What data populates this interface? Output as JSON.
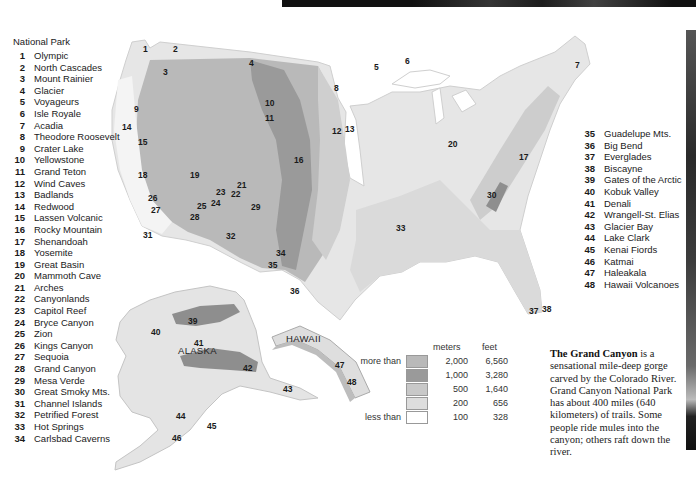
{
  "legend": {
    "title": "National Park",
    "parks_left": [
      {
        "num": "1",
        "name": "Olympic"
      },
      {
        "num": "2",
        "name": "North Cascades"
      },
      {
        "num": "3",
        "name": "Mount Rainier"
      },
      {
        "num": "4",
        "name": "Glacier"
      },
      {
        "num": "5",
        "name": "Voyageurs"
      },
      {
        "num": "6",
        "name": "Isle Royale"
      },
      {
        "num": "7",
        "name": "Acadia"
      },
      {
        "num": "8",
        "name": "Theodore Roosevelt"
      },
      {
        "num": "9",
        "name": "Crater Lake"
      },
      {
        "num": "10",
        "name": "Yellowstone"
      },
      {
        "num": "11",
        "name": "Grand Teton"
      },
      {
        "num": "12",
        "name": "Wind Caves"
      },
      {
        "num": "13",
        "name": "Badlands"
      },
      {
        "num": "14",
        "name": "Redwood"
      },
      {
        "num": "15",
        "name": "Lassen Volcanic"
      },
      {
        "num": "16",
        "name": "Rocky Mountain"
      },
      {
        "num": "17",
        "name": "Shenandoah"
      },
      {
        "num": "18",
        "name": "Yosemite"
      },
      {
        "num": "19",
        "name": "Great Basin"
      },
      {
        "num": "20",
        "name": "Mammoth Cave"
      },
      {
        "num": "21",
        "name": "Arches"
      },
      {
        "num": "22",
        "name": "Canyonlands"
      },
      {
        "num": "23",
        "name": "Capitol Reef"
      },
      {
        "num": "24",
        "name": "Bryce Canyon"
      },
      {
        "num": "25",
        "name": "Zion"
      },
      {
        "num": "26",
        "name": "Kings Canyon"
      },
      {
        "num": "27",
        "name": "Sequoia"
      },
      {
        "num": "28",
        "name": "Grand Canyon"
      },
      {
        "num": "29",
        "name": "Mesa Verde"
      },
      {
        "num": "30",
        "name": "Great Smoky Mts."
      },
      {
        "num": "31",
        "name": "Channel Islands"
      },
      {
        "num": "32",
        "name": "Petrified Forest"
      },
      {
        "num": "33",
        "name": "Hot Springs"
      },
      {
        "num": "34",
        "name": "Carlsbad Caverns"
      }
    ],
    "parks_right": [
      {
        "num": "35",
        "name": "Guadelupe Mts."
      },
      {
        "num": "36",
        "name": "Big Bend"
      },
      {
        "num": "37",
        "name": "Everglades"
      },
      {
        "num": "38",
        "name": "Biscayne"
      },
      {
        "num": "39",
        "name": "Gates of the Arctic"
      },
      {
        "num": "40",
        "name": "Kobuk Valley"
      },
      {
        "num": "41",
        "name": "Denali"
      },
      {
        "num": "42",
        "name": "Wrangell-St. Elias"
      },
      {
        "num": "43",
        "name": "Glacier Bay"
      },
      {
        "num": "44",
        "name": "Lake Clark"
      },
      {
        "num": "45",
        "name": "Kenai Fiords"
      },
      {
        "num": "46",
        "name": "Katmai"
      },
      {
        "num": "47",
        "name": "Haleakala"
      },
      {
        "num": "48",
        "name": "Hawaii Volcanoes"
      }
    ]
  },
  "map": {
    "region_labels": {
      "alaska": "ALASKA",
      "hawaii": "HAWAII"
    },
    "markers": [
      {
        "num": "1",
        "x": 143,
        "y": 44
      },
      {
        "num": "2",
        "x": 173,
        "y": 44
      },
      {
        "num": "3",
        "x": 163,
        "y": 67
      },
      {
        "num": "4",
        "x": 249,
        "y": 58
      },
      {
        "num": "5",
        "x": 374,
        "y": 62
      },
      {
        "num": "6",
        "x": 405,
        "y": 56
      },
      {
        "num": "7",
        "x": 575,
        "y": 60
      },
      {
        "num": "8",
        "x": 334,
        "y": 83
      },
      {
        "num": "9",
        "x": 134,
        "y": 104
      },
      {
        "num": "10",
        "x": 265,
        "y": 98
      },
      {
        "num": "11",
        "x": 265,
        "y": 113
      },
      {
        "num": "12",
        "x": 332,
        "y": 126
      },
      {
        "num": "13",
        "x": 345,
        "y": 124
      },
      {
        "num": "14",
        "x": 122,
        "y": 122
      },
      {
        "num": "15",
        "x": 138,
        "y": 137
      },
      {
        "num": "16",
        "x": 294,
        "y": 155
      },
      {
        "num": "17",
        "x": 519,
        "y": 152
      },
      {
        "num": "18",
        "x": 138,
        "y": 170
      },
      {
        "num": "19",
        "x": 190,
        "y": 170
      },
      {
        "num": "20",
        "x": 448,
        "y": 139
      },
      {
        "num": "21",
        "x": 237,
        "y": 180
      },
      {
        "num": "22",
        "x": 231,
        "y": 189
      },
      {
        "num": "23",
        "x": 216,
        "y": 187
      },
      {
        "num": "24",
        "x": 211,
        "y": 198
      },
      {
        "num": "25",
        "x": 197,
        "y": 201
      },
      {
        "num": "26",
        "x": 148,
        "y": 193
      },
      {
        "num": "27",
        "x": 151,
        "y": 205
      },
      {
        "num": "28",
        "x": 190,
        "y": 212
      },
      {
        "num": "29",
        "x": 251,
        "y": 202
      },
      {
        "num": "30",
        "x": 487,
        "y": 190
      },
      {
        "num": "31",
        "x": 143,
        "y": 230
      },
      {
        "num": "32",
        "x": 226,
        "y": 231
      },
      {
        "num": "33",
        "x": 396,
        "y": 223
      },
      {
        "num": "34",
        "x": 276,
        "y": 248
      },
      {
        "num": "35",
        "x": 268,
        "y": 260
      },
      {
        "num": "36",
        "x": 290,
        "y": 286
      },
      {
        "num": "37",
        "x": 529,
        "y": 306
      },
      {
        "num": "38",
        "x": 542,
        "y": 304
      },
      {
        "num": "39",
        "x": 188,
        "y": 316
      },
      {
        "num": "40",
        "x": 151,
        "y": 327
      },
      {
        "num": "41",
        "x": 194,
        "y": 338
      },
      {
        "num": "42",
        "x": 243,
        "y": 363
      },
      {
        "num": "43",
        "x": 283,
        "y": 384
      },
      {
        "num": "44",
        "x": 176,
        "y": 411
      },
      {
        "num": "45",
        "x": 207,
        "y": 421
      },
      {
        "num": "46",
        "x": 172,
        "y": 433
      },
      {
        "num": "47",
        "x": 335,
        "y": 360
      },
      {
        "num": "48",
        "x": 347,
        "y": 377
      }
    ]
  },
  "elevation_legend": {
    "header_meters": "meters",
    "header_feet": "feet",
    "rows": [
      {
        "prefix": "more than",
        "meters": "2,000",
        "feet": "6,560",
        "color": "#b9b9b9"
      },
      {
        "prefix": "",
        "meters": "1,000",
        "feet": "3,280",
        "color": "#9a9a9a"
      },
      {
        "prefix": "",
        "meters": "500",
        "feet": "1,640",
        "color": "#c8c8c8"
      },
      {
        "prefix": "",
        "meters": "200",
        "feet": "656",
        "color": "#dddddd"
      },
      {
        "prefix": "less than",
        "meters": "100",
        "feet": "328",
        "color": "#ffffff"
      }
    ]
  },
  "caption": {
    "bold": "The Grand Canyon",
    "text": " is a sensational mile-deep gorge carved by the Colorado River. Grand Canyon National Park has about 400 miles (640 kilometers) of trails. Some people ride mules into the canyon; others raft down the river."
  }
}
